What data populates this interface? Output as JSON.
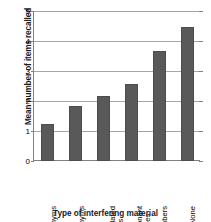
{
  "chart_data": {
    "type": "bar",
    "title": "",
    "xlabel": "Type of interfering material",
    "ylabel": "Mean number of items recalled",
    "categories": [
      "Synonyms",
      "Unrelated words",
      "Antonyms",
      "Consonant syllables",
      "Numbers",
      "None"
    ],
    "category_lines": [
      [
        "Synonyms"
      ],
      [
        "Antonyms"
      ],
      [
        "Unrelated",
        "words"
      ],
      [
        "Consonant",
        "syllables"
      ],
      [
        "Numbers"
      ],
      [
        "None"
      ]
    ],
    "values": [
      1.25,
      1.85,
      2.17,
      2.57,
      3.67,
      4.47
    ],
    "ylim": [
      0,
      5
    ],
    "yticks": [
      0,
      1,
      2,
      3,
      4,
      5
    ],
    "ytick_labels": [
      "0",
      "1",
      "2",
      "3",
      "4",
      "5"
    ],
    "grid": true,
    "legend": false,
    "bar_color": "#595959",
    "grid_color": "#a6a6a6",
    "axis_color": "#808080"
  }
}
